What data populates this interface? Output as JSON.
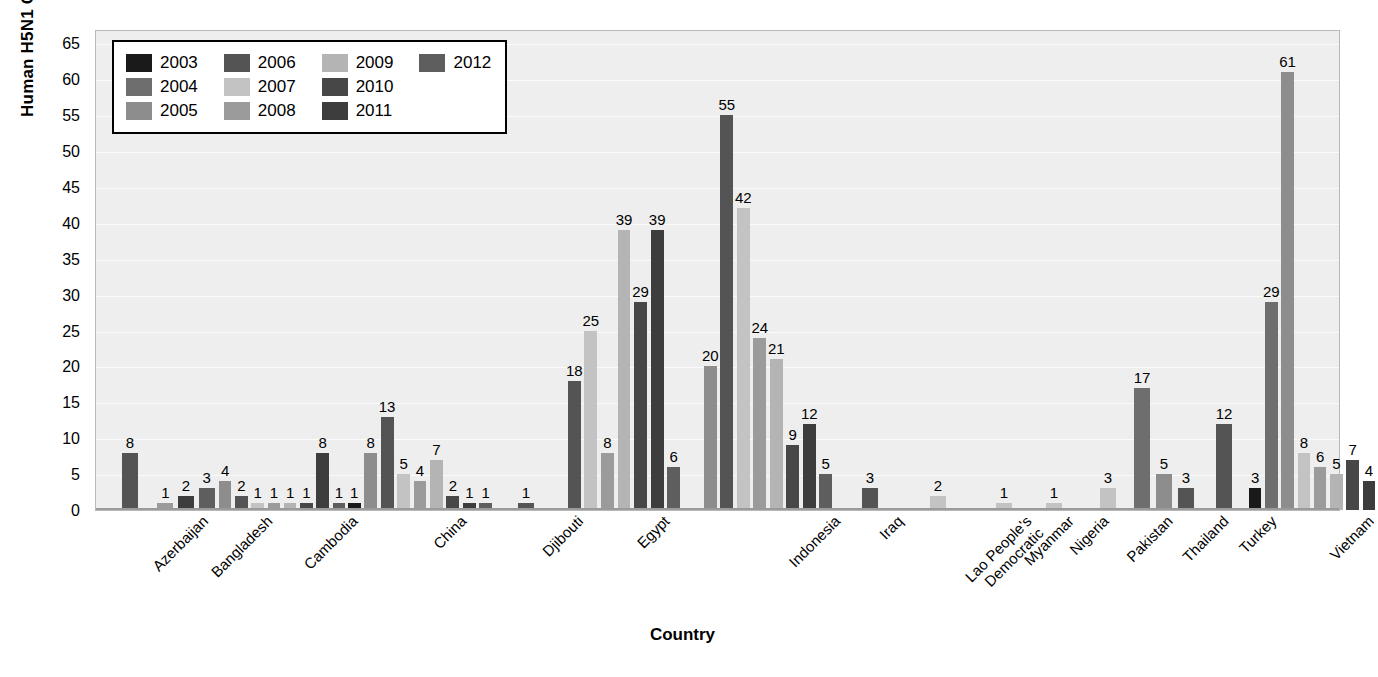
{
  "chart_data": {
    "type": "bar",
    "title": "",
    "xlabel": "Country",
    "ylabel": "Human H5N1 Cases",
    "ylim": [
      0,
      67
    ],
    "yticks": [
      0,
      5,
      10,
      15,
      20,
      25,
      30,
      35,
      40,
      45,
      50,
      55,
      60,
      65
    ],
    "grid": true,
    "legend_position": "top-left",
    "legend_title": "",
    "categories": [
      "Azerbaijan",
      "Bangladesh",
      "Cambodia",
      "China",
      "Djibouti",
      "Egypt",
      "Indonesia",
      "Iraq",
      "Lao People's Democratic",
      "Myanmar",
      "Nigeria",
      "Pakistan",
      "Thailand",
      "Turkey",
      "Vietnam"
    ],
    "category_label_lines": [
      [
        "Azerbaijan"
      ],
      [
        "Bangladesh"
      ],
      [
        "Cambodia"
      ],
      [
        "China"
      ],
      [
        "Djibouti"
      ],
      [
        "Egypt"
      ],
      [
        "Indonesia"
      ],
      [
        "Iraq"
      ],
      [
        "Lao People's",
        "Democratic"
      ],
      [
        "Myanmar"
      ],
      [
        "Nigeria"
      ],
      [
        "Pakistan"
      ],
      [
        "Thailand"
      ],
      [
        "Turkey"
      ],
      [
        "Vietnam"
      ]
    ],
    "series": [
      {
        "name": "2003",
        "color": "#1a1a1a"
      },
      {
        "name": "2004",
        "color": "#6e6e6e"
      },
      {
        "name": "2005",
        "color": "#8d8d8d"
      },
      {
        "name": "2006",
        "color": "#545454"
      },
      {
        "name": "2007",
        "color": "#c3c3c3"
      },
      {
        "name": "2008",
        "color": "#9b9b9b"
      },
      {
        "name": "2009",
        "color": "#b4b4b4"
      },
      {
        "name": "2010",
        "color": "#474747"
      },
      {
        "name": "2011",
        "color": "#3d3d3d"
      },
      {
        "name": "2012",
        "color": "#5e5e5e"
      }
    ],
    "bars": [
      {
        "category": "Azerbaijan",
        "points": [
          {
            "series": "2006",
            "value": 8
          }
        ]
      },
      {
        "category": "Bangladesh",
        "points": [
          {
            "series": "2008",
            "value": 1
          },
          {
            "series": "2011",
            "value": 2
          },
          {
            "series": "2012",
            "value": 3
          }
        ]
      },
      {
        "category": "Cambodia",
        "points": [
          {
            "series": "2005",
            "value": 4
          },
          {
            "series": "2006",
            "value": 2
          },
          {
            "series": "2007",
            "value": 1
          },
          {
            "series": "2008",
            "value": 1
          },
          {
            "series": "2009",
            "value": 1
          },
          {
            "series": "2010",
            "value": 1
          },
          {
            "series": "2011",
            "value": 8
          },
          {
            "series": "2012",
            "value": 1
          }
        ]
      },
      {
        "category": "China",
        "points": [
          {
            "series": "2003",
            "value": 1
          },
          {
            "series": "2005",
            "value": 8
          },
          {
            "series": "2006",
            "value": 13
          },
          {
            "series": "2007",
            "value": 5
          },
          {
            "series": "2008",
            "value": 4
          },
          {
            "series": "2009",
            "value": 7
          },
          {
            "series": "2010",
            "value": 2
          },
          {
            "series": "2011",
            "value": 1
          },
          {
            "series": "2012",
            "value": 1
          }
        ]
      },
      {
        "category": "Djibouti",
        "points": [
          {
            "series": "2006",
            "value": 1
          }
        ]
      },
      {
        "category": "Egypt",
        "points": [
          {
            "series": "2006",
            "value": 18
          },
          {
            "series": "2007",
            "value": 25
          },
          {
            "series": "2008",
            "value": 8
          },
          {
            "series": "2009",
            "value": 39
          },
          {
            "series": "2010",
            "value": 29
          },
          {
            "series": "2011",
            "value": 39
          },
          {
            "series": "2012",
            "value": 6
          }
        ]
      },
      {
        "category": "Indonesia",
        "points": [
          {
            "series": "2005",
            "value": 20
          },
          {
            "series": "2006",
            "value": 55
          },
          {
            "series": "2007",
            "value": 42
          },
          {
            "series": "2008",
            "value": 24
          },
          {
            "series": "2009",
            "value": 21
          },
          {
            "series": "2010",
            "value": 9
          },
          {
            "series": "2011",
            "value": 12
          },
          {
            "series": "2012",
            "value": 5
          }
        ]
      },
      {
        "category": "Iraq",
        "points": [
          {
            "series": "2006",
            "value": 3
          }
        ]
      },
      {
        "category": "Lao People's Democratic",
        "points": [
          {
            "series": "2007",
            "value": 2
          }
        ]
      },
      {
        "category": "Myanmar",
        "points": [
          {
            "series": "2007",
            "value": 1
          }
        ]
      },
      {
        "category": "Nigeria",
        "points": [
          {
            "series": "2007",
            "value": 1
          }
        ]
      },
      {
        "category": "Pakistan",
        "points": [
          {
            "series": "2007",
            "value": 3
          }
        ]
      },
      {
        "category": "Thailand",
        "points": [
          {
            "series": "2004",
            "value": 17
          },
          {
            "series": "2005",
            "value": 5
          },
          {
            "series": "2006",
            "value": 3
          }
        ]
      },
      {
        "category": "Turkey",
        "points": [
          {
            "series": "2006",
            "value": 12
          }
        ]
      },
      {
        "category": "Vietnam",
        "points": [
          {
            "series": "2003",
            "value": 3
          },
          {
            "series": "2004",
            "value": 29
          },
          {
            "series": "2005",
            "value": 61
          },
          {
            "series": "2007",
            "value": 8
          },
          {
            "series": "2008",
            "value": 6
          },
          {
            "series": "2009",
            "value": 5
          },
          {
            "series": "2010",
            "value": 7
          },
          {
            "series": "2011",
            "value": 4
          }
        ]
      }
    ]
  },
  "legend": {
    "rows": [
      [
        {
          "label": "2003"
        },
        {
          "label": "2006"
        },
        {
          "label": "2009"
        },
        {
          "label": "2012"
        }
      ],
      [
        {
          "label": "2004"
        },
        {
          "label": "2007"
        },
        {
          "label": "2010"
        }
      ],
      [
        {
          "label": "2005"
        },
        {
          "label": "2008"
        },
        {
          "label": "2011"
        }
      ]
    ]
  },
  "colors": {
    "plot_background": "#eeeeee",
    "gridline": "#fbfbfb",
    "axis": "#9a9a9a",
    "text": "#000000",
    "legend_background": "#ffffff",
    "legend_border": "#000000"
  }
}
